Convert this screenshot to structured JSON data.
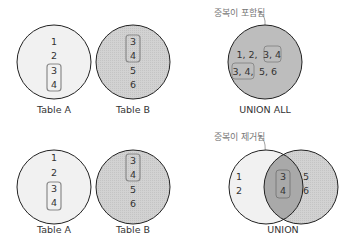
{
  "colors": {
    "table_a_fill": "#f1f1f1",
    "table_b_fill": "#d4d4d4",
    "union_all_fill": "#bdbdbd",
    "intersection_fill": "#a9a9a9",
    "outline": "#222222",
    "highlight_box": "#8a8a8a",
    "annotation": "#777777"
  },
  "top": {
    "table_a": {
      "label": "Table A",
      "values": [
        "1",
        "2",
        "3",
        "4"
      ]
    },
    "table_b": {
      "label": "Table B",
      "values": [
        "3",
        "4",
        "5",
        "6"
      ]
    },
    "result": {
      "label": "UNION ALL",
      "row1_plain": "1, 2,",
      "row1_box": "3, 4",
      "row2_box": "3, 4,",
      "row2_plain": "5, 6",
      "annotation": "중복이 포함됨"
    }
  },
  "bottom": {
    "table_a": {
      "label": "Table A",
      "values": [
        "1",
        "2",
        "3",
        "4"
      ]
    },
    "table_b": {
      "label": "Table B",
      "values": [
        "3",
        "4",
        "5",
        "6"
      ]
    },
    "result": {
      "label": "UNION",
      "left_values": [
        "1",
        "2"
      ],
      "intersection_values": [
        "3",
        "4"
      ],
      "right_values": [
        "5",
        "6"
      ],
      "annotation": "중복이 제거됨"
    }
  }
}
